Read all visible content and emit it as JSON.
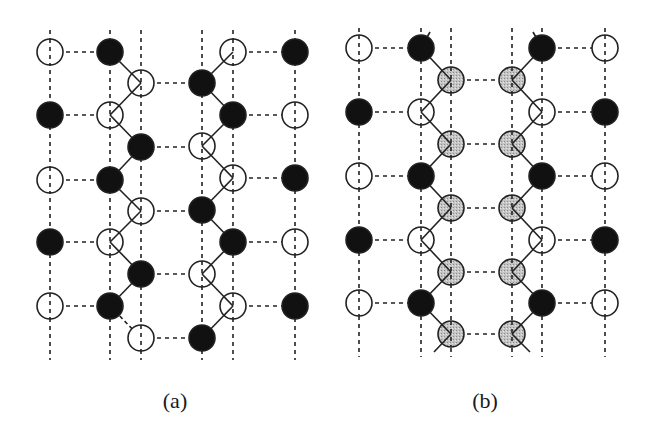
{
  "figure": {
    "colors": {
      "black": "#111111",
      "white": "#ffffff",
      "gray": "#bdbdbd",
      "line": "#222222"
    },
    "atom_radius": 13,
    "panels": [
      {
        "id": "a",
        "caption": "(a)",
        "caption_x": 175,
        "vlines": {
          "xs": [
            50,
            110,
            141,
            202,
            233,
            295
          ],
          "y_top": 30,
          "y_bottom": 360
        },
        "atoms": [
          {
            "x": 50,
            "y": 52,
            "fill": "white"
          },
          {
            "x": 50,
            "y": 115,
            "fill": "black"
          },
          {
            "x": 50,
            "y": 180,
            "fill": "white"
          },
          {
            "x": 50,
            "y": 242,
            "fill": "black"
          },
          {
            "x": 50,
            "y": 306,
            "fill": "white"
          },
          {
            "x": 110,
            "y": 52,
            "fill": "black"
          },
          {
            "x": 110,
            "y": 115,
            "fill": "white"
          },
          {
            "x": 110,
            "y": 180,
            "fill": "black"
          },
          {
            "x": 110,
            "y": 242,
            "fill": "white"
          },
          {
            "x": 110,
            "y": 306,
            "fill": "black"
          },
          {
            "x": 141,
            "y": 83,
            "fill": "white"
          },
          {
            "x": 141,
            "y": 147,
            "fill": "black"
          },
          {
            "x": 141,
            "y": 211,
            "fill": "white"
          },
          {
            "x": 141,
            "y": 274,
            "fill": "black"
          },
          {
            "x": 141,
            "y": 338,
            "fill": "white"
          },
          {
            "x": 202,
            "y": 83,
            "fill": "black"
          },
          {
            "x": 202,
            "y": 146,
            "fill": "white"
          },
          {
            "x": 202,
            "y": 210,
            "fill": "black"
          },
          {
            "x": 202,
            "y": 274,
            "fill": "white"
          },
          {
            "x": 202,
            "y": 338,
            "fill": "black"
          },
          {
            "x": 233,
            "y": 52,
            "fill": "white"
          },
          {
            "x": 233,
            "y": 115,
            "fill": "black"
          },
          {
            "x": 233,
            "y": 178,
            "fill": "white"
          },
          {
            "x": 233,
            "y": 242,
            "fill": "black"
          },
          {
            "x": 233,
            "y": 306,
            "fill": "white"
          },
          {
            "x": 295,
            "y": 52,
            "fill": "black"
          },
          {
            "x": 295,
            "y": 115,
            "fill": "white"
          },
          {
            "x": 295,
            "y": 178,
            "fill": "black"
          },
          {
            "x": 295,
            "y": 242,
            "fill": "white"
          },
          {
            "x": 295,
            "y": 306,
            "fill": "black"
          }
        ],
        "hbonds": [
          [
            50,
            110,
            52
          ],
          [
            50,
            110,
            115
          ],
          [
            50,
            110,
            180
          ],
          [
            50,
            110,
            242
          ],
          [
            50,
            110,
            306
          ],
          [
            141,
            202,
            83
          ],
          [
            141,
            202,
            147
          ],
          [
            141,
            202,
            211
          ],
          [
            141,
            202,
            274
          ],
          [
            141,
            202,
            338
          ],
          [
            233,
            295,
            52
          ],
          [
            233,
            295,
            115
          ],
          [
            233,
            295,
            178
          ],
          [
            233,
            295,
            242
          ],
          [
            233,
            295,
            306
          ]
        ],
        "bonds": [
          [
            110,
            52,
            141,
            83
          ],
          [
            141,
            83,
            110,
            115
          ],
          [
            110,
            115,
            141,
            147
          ],
          [
            141,
            147,
            110,
            180
          ],
          [
            110,
            180,
            141,
            211
          ],
          [
            141,
            211,
            110,
            242
          ],
          [
            110,
            242,
            141,
            274
          ],
          [
            141,
            274,
            110,
            306
          ],
          [
            233,
            52,
            202,
            83
          ],
          [
            202,
            83,
            233,
            115
          ],
          [
            233,
            115,
            202,
            146
          ],
          [
            202,
            146,
            233,
            178
          ],
          [
            233,
            178,
            202,
            210
          ],
          [
            202,
            210,
            233,
            242
          ],
          [
            233,
            242,
            202,
            274
          ],
          [
            202,
            274,
            233,
            306
          ],
          [
            233,
            306,
            202,
            338
          ]
        ],
        "dashed_bonds": [
          [
            110,
            306,
            141,
            338
          ]
        ]
      },
      {
        "id": "b",
        "caption": "(b)",
        "caption_x": 485,
        "vlines": {
          "xs": [
            359,
            421,
            451,
            512,
            542,
            605
          ],
          "y_top": 28,
          "y_bottom": 357
        },
        "atoms": [
          {
            "x": 359,
            "y": 48,
            "fill": "white"
          },
          {
            "x": 359,
            "y": 112,
            "fill": "black"
          },
          {
            "x": 359,
            "y": 176,
            "fill": "white"
          },
          {
            "x": 359,
            "y": 240,
            "fill": "black"
          },
          {
            "x": 359,
            "y": 303,
            "fill": "white"
          },
          {
            "x": 421,
            "y": 48,
            "fill": "black"
          },
          {
            "x": 421,
            "y": 112,
            "fill": "white"
          },
          {
            "x": 421,
            "y": 176,
            "fill": "black"
          },
          {
            "x": 421,
            "y": 240,
            "fill": "white"
          },
          {
            "x": 421,
            "y": 303,
            "fill": "black"
          },
          {
            "x": 451,
            "y": 80,
            "fill": "gray"
          },
          {
            "x": 451,
            "y": 144,
            "fill": "gray"
          },
          {
            "x": 451,
            "y": 208,
            "fill": "gray"
          },
          {
            "x": 451,
            "y": 272,
            "fill": "gray"
          },
          {
            "x": 451,
            "y": 334,
            "fill": "gray"
          },
          {
            "x": 512,
            "y": 80,
            "fill": "gray"
          },
          {
            "x": 512,
            "y": 144,
            "fill": "gray"
          },
          {
            "x": 512,
            "y": 208,
            "fill": "gray"
          },
          {
            "x": 512,
            "y": 272,
            "fill": "gray"
          },
          {
            "x": 512,
            "y": 334,
            "fill": "gray"
          },
          {
            "x": 542,
            "y": 48,
            "fill": "black"
          },
          {
            "x": 542,
            "y": 112,
            "fill": "white"
          },
          {
            "x": 542,
            "y": 176,
            "fill": "black"
          },
          {
            "x": 542,
            "y": 240,
            "fill": "white"
          },
          {
            "x": 542,
            "y": 303,
            "fill": "black"
          },
          {
            "x": 605,
            "y": 48,
            "fill": "white"
          },
          {
            "x": 605,
            "y": 112,
            "fill": "black"
          },
          {
            "x": 605,
            "y": 176,
            "fill": "white"
          },
          {
            "x": 605,
            "y": 240,
            "fill": "black"
          },
          {
            "x": 605,
            "y": 303,
            "fill": "white"
          }
        ],
        "hbonds": [
          [
            359,
            421,
            48
          ],
          [
            359,
            421,
            112
          ],
          [
            359,
            421,
            176
          ],
          [
            359,
            421,
            240
          ],
          [
            359,
            421,
            303
          ],
          [
            451,
            512,
            80
          ],
          [
            451,
            512,
            144
          ],
          [
            451,
            512,
            208
          ],
          [
            451,
            512,
            272
          ],
          [
            451,
            512,
            334
          ],
          [
            542,
            605,
            48
          ],
          [
            542,
            605,
            112
          ],
          [
            542,
            605,
            176
          ],
          [
            542,
            605,
            240
          ],
          [
            542,
            605,
            303
          ]
        ],
        "bonds": [
          [
            421,
            48,
            451,
            80
          ],
          [
            451,
            80,
            421,
            112
          ],
          [
            421,
            112,
            451,
            144
          ],
          [
            451,
            144,
            421,
            176
          ],
          [
            421,
            176,
            451,
            208
          ],
          [
            451,
            208,
            421,
            240
          ],
          [
            421,
            240,
            451,
            272
          ],
          [
            451,
            272,
            421,
            303
          ],
          [
            421,
            303,
            451,
            334
          ],
          [
            542,
            48,
            512,
            80
          ],
          [
            512,
            80,
            542,
            112
          ],
          [
            542,
            112,
            512,
            144
          ],
          [
            512,
            144,
            542,
            176
          ],
          [
            542,
            176,
            512,
            208
          ],
          [
            512,
            208,
            542,
            240
          ],
          [
            542,
            240,
            512,
            272
          ],
          [
            512,
            272,
            542,
            303
          ],
          [
            542,
            303,
            512,
            334
          ],
          [
            421,
            48,
            430,
            32
          ],
          [
            542,
            48,
            533,
            32
          ],
          [
            451,
            334,
            434,
            352
          ],
          [
            512,
            334,
            530,
            352
          ]
        ],
        "dashed_bonds": []
      }
    ]
  }
}
